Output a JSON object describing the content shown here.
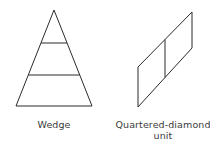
{
  "figures": [
    {
      "id": "wedge",
      "label": "Wedge",
      "shape": "triangle-with-two-horizontal-divisions",
      "stroke_color": "#2b2b2b"
    },
    {
      "id": "quartered-diamond",
      "label_line1": "Quartered-diamond",
      "label_line2": "unit",
      "shape": "parallelogram-split-by-vertical-line",
      "stroke_color": "#2b2b2b"
    }
  ]
}
